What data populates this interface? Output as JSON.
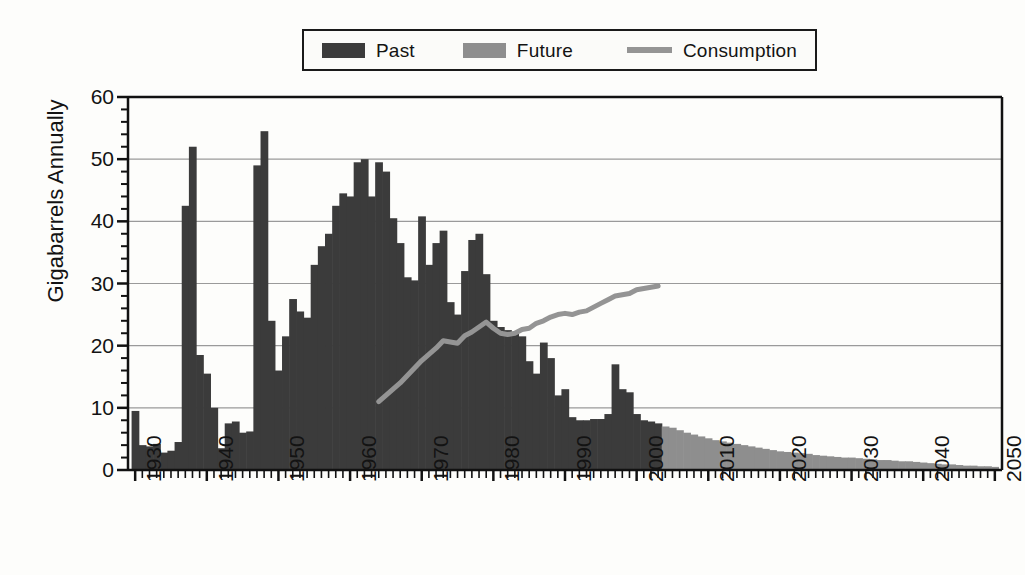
{
  "chart_data": {
    "type": "bar",
    "title": "",
    "subtitle": "",
    "xlabel": "",
    "ylabel": "Gigabarrels Annually",
    "xlim": [
      1929,
      2051
    ],
    "ylim": [
      0,
      60
    ],
    "ytick_values": [
      0,
      10,
      20,
      30,
      40,
      50,
      60
    ],
    "ytick_labels": [
      "0",
      "10",
      "20",
      "30",
      "40",
      "50",
      "60"
    ],
    "yminor_step": 2,
    "xtick_values": [
      1930,
      1940,
      1950,
      1960,
      1970,
      1980,
      1990,
      2000,
      2010,
      2020,
      2030,
      2040,
      2050
    ],
    "xtick_labels": [
      "1930",
      "1940",
      "1950",
      "1960",
      "1970",
      "1980",
      "1990",
      "2000",
      "2010",
      "2020",
      "2030",
      "2040",
      "2050"
    ],
    "xminor_step": 1,
    "grid": "horizontal-major",
    "legend_position": "top-center",
    "colors": {
      "past": "#3b3b3b",
      "future": "#8e8e8e",
      "consumption": "#949494",
      "axis": "#111111",
      "grid": "#9a9a9a",
      "background": "#fdfdfb"
    },
    "legend": [
      {
        "name": "Past",
        "type": "bar",
        "color": "#3b3b3b"
      },
      {
        "name": "Future",
        "type": "bar",
        "color": "#8e8e8e"
      },
      {
        "name": "Consumption",
        "type": "line",
        "color": "#949494"
      }
    ],
    "series": [
      {
        "name": "Past",
        "type": "bar",
        "color": "#3b3b3b",
        "x": [
          1930,
          1931,
          1932,
          1933,
          1934,
          1935,
          1936,
          1937,
          1938,
          1939,
          1940,
          1941,
          1942,
          1943,
          1944,
          1945,
          1946,
          1947,
          1948,
          1949,
          1950,
          1951,
          1952,
          1953,
          1954,
          1955,
          1956,
          1957,
          1958,
          1959,
          1960,
          1961,
          1962,
          1963,
          1964,
          1965,
          1966,
          1967,
          1968,
          1969,
          1970,
          1971,
          1972,
          1973,
          1974,
          1975,
          1976,
          1977,
          1978,
          1979,
          1980,
          1981,
          1982,
          1983,
          1984,
          1985,
          1986,
          1987,
          1988,
          1989,
          1990,
          1991,
          1992,
          1993,
          1994,
          1995,
          1996,
          1997,
          1998,
          1999,
          2000,
          2001,
          2002,
          2003
        ],
        "values": [
          9.5,
          4.0,
          3.8,
          4.2,
          2.8,
          3.1,
          4.5,
          42.5,
          52.0,
          18.5,
          15.5,
          10.0,
          3.5,
          7.5,
          7.8,
          6.0,
          6.2,
          49.0,
          54.5,
          24.0,
          16.0,
          21.5,
          27.5,
          25.5,
          24.5,
          33.0,
          36.0,
          38.0,
          42.5,
          44.5,
          44.0,
          49.5,
          50.0,
          44.0,
          49.5,
          48.0,
          40.5,
          36.5,
          31.0,
          30.5,
          40.8,
          33.0,
          36.5,
          38.5,
          27.0,
          25.0,
          32.0,
          37.0,
          38.0,
          31.5,
          24.0,
          23.0,
          22.5,
          22.0,
          21.5,
          17.5,
          15.5,
          20.5,
          18.0,
          12.0,
          13.0,
          8.5,
          8.0,
          8.0,
          8.2,
          8.2,
          9.0,
          17.0,
          13.0,
          12.5,
          9.0,
          8.0,
          7.8,
          7.5
        ],
        "note": "Annual discoveries, historical"
      },
      {
        "name": "Future",
        "type": "bar",
        "color": "#8e8e8e",
        "x": [
          2004,
          2005,
          2006,
          2007,
          2008,
          2009,
          2010,
          2011,
          2012,
          2013,
          2014,
          2015,
          2016,
          2017,
          2018,
          2019,
          2020,
          2021,
          2022,
          2023,
          2024,
          2025,
          2026,
          2027,
          2028,
          2029,
          2030,
          2031,
          2032,
          2033,
          2034,
          2035,
          2036,
          2037,
          2038,
          2039,
          2040,
          2041,
          2042,
          2043,
          2044,
          2045,
          2046,
          2047,
          2048,
          2049,
          2050
        ],
        "values": [
          7.0,
          6.8,
          6.4,
          6.0,
          5.7,
          5.4,
          5.1,
          4.8,
          4.6,
          4.4,
          4.2,
          4.0,
          3.8,
          3.6,
          3.4,
          3.2,
          3.0,
          2.9,
          2.8,
          2.7,
          2.6,
          2.4,
          2.3,
          2.2,
          2.1,
          2.0,
          2.0,
          1.9,
          1.8,
          1.7,
          1.6,
          1.6,
          1.5,
          1.4,
          1.4,
          1.3,
          1.2,
          1.1,
          1.0,
          0.9,
          0.9,
          0.8,
          0.7,
          0.7,
          0.6,
          0.6,
          0.5
        ],
        "note": "Projected future discoveries"
      },
      {
        "name": "Consumption",
        "type": "line",
        "color": "#949494",
        "x": [
          1964,
          1965,
          1966,
          1967,
          1968,
          1969,
          1970,
          1971,
          1972,
          1973,
          1974,
          1975,
          1976,
          1977,
          1978,
          1979,
          1980,
          1981,
          1982,
          1983,
          1984,
          1985,
          1986,
          1987,
          1988,
          1989,
          1990,
          1991,
          1992,
          1993,
          1994,
          1995,
          1996,
          1997,
          1998,
          1999,
          2000,
          2001,
          2002,
          2003
        ],
        "values": [
          11.0,
          12.0,
          13.0,
          14.0,
          15.2,
          16.4,
          17.6,
          18.6,
          19.6,
          20.8,
          20.6,
          20.4,
          21.6,
          22.2,
          23.0,
          23.8,
          22.8,
          22.0,
          21.8,
          22.0,
          22.6,
          22.8,
          23.6,
          24.0,
          24.6,
          25.0,
          25.2,
          25.0,
          25.4,
          25.6,
          26.2,
          26.8,
          27.4,
          28.0,
          28.2,
          28.4,
          29.0,
          29.2,
          29.4,
          29.6
        ],
        "note": "Annual oil consumption"
      }
    ]
  },
  "axes": {
    "ylabel": "Gigabarrels Annually"
  }
}
